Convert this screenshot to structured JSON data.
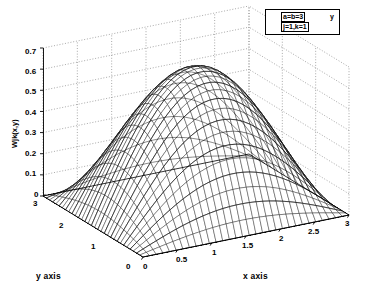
{
  "figure": {
    "kind": "matlab-mesh-surface-plot",
    "background_color": "#ffffff",
    "mesh_color": "#000000",
    "grid_color": "#808080",
    "axis_color": "#000000"
  },
  "legend": {
    "line1": "a=b=3",
    "line2": "j=1,k=1",
    "mark": "y"
  },
  "axes": {
    "x": {
      "label": "x axis",
      "ticks": [
        "0",
        "0.5",
        "1",
        "1.5",
        "2",
        "2.5",
        "3"
      ],
      "range": [
        0,
        3
      ]
    },
    "y": {
      "label": "y axis",
      "ticks": [
        "0",
        "1",
        "2",
        "3"
      ],
      "range": [
        0,
        3
      ]
    },
    "z": {
      "label": "Wjk(x,y)",
      "ticks": [
        "0",
        "0.1",
        "0.2",
        "0.3",
        "0.4",
        "0.5",
        "0.6",
        "0.7"
      ],
      "range": [
        0,
        0.7
      ]
    }
  },
  "chart_data": {
    "type": "surface",
    "title": "",
    "xlabel": "x axis",
    "ylabel": "y axis",
    "zlabel": "Wjk(x,y)",
    "xlim": [
      0,
      3
    ],
    "ylim": [
      0,
      3
    ],
    "zlim": [
      0,
      0.7
    ],
    "xticks": [
      0,
      0.5,
      1,
      1.5,
      2,
      2.5,
      3
    ],
    "yticks": [
      0,
      1,
      2,
      3
    ],
    "zticks": [
      0,
      0.1,
      0.2,
      0.3,
      0.4,
      0.5,
      0.6,
      0.7
    ],
    "grid": true,
    "legend_position": "top-right",
    "annotations": [
      "a=b=3",
      "j=1,k=1"
    ],
    "parameters": {
      "a": 3,
      "b": 3,
      "j": 1,
      "k": 1
    },
    "formula": "Wjk(x,y) = A*sin(j*pi*x/a)*sin(k*pi*y/b)",
    "amplitude": 0.6535,
    "peak": {
      "x": 1.5,
      "y": 1.5,
      "z": 0.65
    },
    "mesh_n": 31,
    "view": {
      "azimuth": -37.5,
      "elevation": 30
    },
    "boundary_values": 0
  }
}
